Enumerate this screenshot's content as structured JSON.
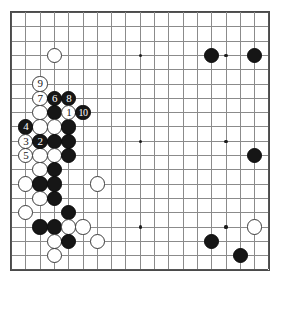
{
  "board": {
    "title": "Go game board diagram",
    "size": 19,
    "colors": {
      "background": "#ffffff",
      "grid_line": "#8b8b8b",
      "edge_line": "#4a4a4a",
      "black_stone": "#161616",
      "white_stone": "#ffffff",
      "star_point": "#1c1c1c",
      "black_label_text": "#ffffff",
      "white_label_text": "#161616"
    },
    "geometry": {
      "origin_x": 11,
      "origin_y": 12,
      "spacing": 14.3,
      "stone_diameter": 15.4,
      "star_diameter": 3.2
    },
    "star_points": [
      {
        "col": 4,
        "row": 4
      },
      {
        "col": 10,
        "row": 4
      },
      {
        "col": 16,
        "row": 4
      },
      {
        "col": 4,
        "row": 10
      },
      {
        "col": 10,
        "row": 10
      },
      {
        "col": 16,
        "row": 10
      },
      {
        "col": 4,
        "row": 16
      },
      {
        "col": 10,
        "row": 16
      },
      {
        "col": 16,
        "row": 16
      }
    ],
    "stones": [
      {
        "col": 4,
        "row": 4,
        "color": "white",
        "label": ""
      },
      {
        "col": 3,
        "row": 6,
        "color": "white",
        "label": "9"
      },
      {
        "col": 3,
        "row": 7,
        "color": "white",
        "label": "7"
      },
      {
        "col": 4,
        "row": 7,
        "color": "black",
        "label": "6"
      },
      {
        "col": 5,
        "row": 7,
        "color": "black",
        "label": "8"
      },
      {
        "col": 3,
        "row": 8,
        "color": "white",
        "label": ""
      },
      {
        "col": 4,
        "row": 8,
        "color": "black",
        "label": ""
      },
      {
        "col": 5,
        "row": 8,
        "color": "white",
        "label": "1"
      },
      {
        "col": 6,
        "row": 8,
        "color": "black",
        "label": "10"
      },
      {
        "col": 2,
        "row": 9,
        "color": "black",
        "label": "4"
      },
      {
        "col": 3,
        "row": 9,
        "color": "white",
        "label": ""
      },
      {
        "col": 4,
        "row": 9,
        "color": "white",
        "label": ""
      },
      {
        "col": 5,
        "row": 9,
        "color": "black",
        "label": ""
      },
      {
        "col": 2,
        "row": 10,
        "color": "white",
        "label": "3"
      },
      {
        "col": 3,
        "row": 10,
        "color": "black",
        "label": "2"
      },
      {
        "col": 4,
        "row": 10,
        "color": "black",
        "label": ""
      },
      {
        "col": 5,
        "row": 10,
        "color": "black",
        "label": ""
      },
      {
        "col": 2,
        "row": 11,
        "color": "white",
        "label": "5"
      },
      {
        "col": 3,
        "row": 11,
        "color": "white",
        "label": ""
      },
      {
        "col": 4,
        "row": 11,
        "color": "white",
        "label": ""
      },
      {
        "col": 5,
        "row": 11,
        "color": "black",
        "label": ""
      },
      {
        "col": 3,
        "row": 12,
        "color": "white",
        "label": ""
      },
      {
        "col": 4,
        "row": 12,
        "color": "black",
        "label": ""
      },
      {
        "col": 2,
        "row": 13,
        "color": "white",
        "label": ""
      },
      {
        "col": 3,
        "row": 13,
        "color": "black",
        "label": ""
      },
      {
        "col": 4,
        "row": 13,
        "color": "black",
        "label": ""
      },
      {
        "col": 3,
        "row": 14,
        "color": "white",
        "label": ""
      },
      {
        "col": 4,
        "row": 14,
        "color": "black",
        "label": ""
      },
      {
        "col": 2,
        "row": 15,
        "color": "white",
        "label": ""
      },
      {
        "col": 5,
        "row": 15,
        "color": "black",
        "label": ""
      },
      {
        "col": 7,
        "row": 13,
        "color": "white",
        "label": ""
      },
      {
        "col": 3,
        "row": 16,
        "color": "black",
        "label": ""
      },
      {
        "col": 4,
        "row": 16,
        "color": "black",
        "label": ""
      },
      {
        "col": 5,
        "row": 16,
        "color": "white",
        "label": ""
      },
      {
        "col": 6,
        "row": 16,
        "color": "white",
        "label": ""
      },
      {
        "col": 4,
        "row": 17,
        "color": "white",
        "label": ""
      },
      {
        "col": 5,
        "row": 17,
        "color": "black",
        "label": ""
      },
      {
        "col": 7,
        "row": 17,
        "color": "white",
        "label": ""
      },
      {
        "col": 4,
        "row": 18,
        "color": "white",
        "label": ""
      },
      {
        "col": 15,
        "row": 4,
        "color": "black",
        "label": ""
      },
      {
        "col": 18,
        "row": 4,
        "color": "black",
        "label": ""
      },
      {
        "col": 18,
        "row": 11,
        "color": "black",
        "label": ""
      },
      {
        "col": 18,
        "row": 16,
        "color": "white",
        "label": ""
      },
      {
        "col": 15,
        "row": 17,
        "color": "black",
        "label": ""
      },
      {
        "col": 17,
        "row": 18,
        "color": "black",
        "label": ""
      }
    ],
    "move_labels": [
      "1",
      "2",
      "3",
      "4",
      "5",
      "6",
      "7",
      "8",
      "9",
      "10"
    ]
  }
}
